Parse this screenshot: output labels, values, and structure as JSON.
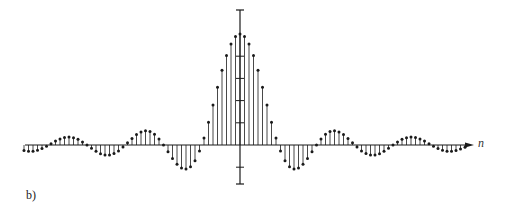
{
  "figure": {
    "panel_label": "b)",
    "axis_label_x": "n"
  },
  "colors": {
    "ink": "#1a1a1a",
    "background": "#ffffff"
  },
  "chart_data": {
    "type": "stem",
    "title": "",
    "xlabel": "n",
    "ylabel": "",
    "x_range": [
      -48,
      50
    ],
    "ylim": [
      -0.25,
      1.2
    ],
    "grid": false,
    "legend": null,
    "y_axis_ticks": [
      -0.2,
      0.2,
      0.4,
      0.6,
      0.8,
      1.2
    ],
    "n": [
      -48,
      -47,
      -46,
      -45,
      -44,
      -43,
      -42,
      -41,
      -40,
      -39,
      -38,
      -37,
      -36,
      -35,
      -34,
      -33,
      -32,
      -31,
      -30,
      -29,
      -28,
      -27,
      -26,
      -25,
      -24,
      -23,
      -22,
      -21,
      -20,
      -19,
      -18,
      -17,
      -16,
      -15,
      -14,
      -13,
      -12,
      -11,
      -10,
      -9,
      -8,
      -7,
      -6,
      -5,
      -4,
      -3,
      -2,
      -1,
      0,
      1,
      2,
      3,
      4,
      5,
      6,
      7,
      8,
      9,
      10,
      11,
      12,
      13,
      14,
      15,
      16,
      17,
      18,
      19,
      20,
      21,
      22,
      23,
      24,
      25,
      26,
      27,
      28,
      29,
      30,
      31,
      32,
      33,
      34,
      35,
      36,
      37,
      38,
      39,
      40,
      41,
      42,
      43,
      44,
      45,
      46,
      47,
      48,
      49,
      50
    ],
    "values": [
      -0.05,
      -0.057,
      -0.057,
      -0.048,
      -0.032,
      -0.012,
      0.012,
      0.035,
      0.054,
      0.067,
      0.071,
      0.065,
      0.051,
      0.028,
      0.0,
      -0.03,
      -0.057,
      -0.078,
      -0.09,
      -0.09,
      -0.077,
      -0.053,
      -0.019,
      0.02,
      0.059,
      0.094,
      0.118,
      0.128,
      0.121,
      0.096,
      0.054,
      0.0,
      -0.061,
      -0.122,
      -0.173,
      -0.207,
      -0.217,
      -0.196,
      -0.143,
      -0.055,
      0.062,
      0.204,
      0.36,
      0.52,
      0.673,
      0.807,
      0.911,
      0.977,
      1.0,
      0.977,
      0.911,
      0.807,
      0.673,
      0.52,
      0.36,
      0.204,
      0.062,
      -0.055,
      -0.143,
      -0.196,
      -0.217,
      -0.207,
      -0.173,
      -0.122,
      -0.061,
      0.0,
      0.054,
      0.096,
      0.121,
      0.128,
      0.118,
      0.094,
      0.059,
      0.02,
      -0.019,
      -0.053,
      -0.077,
      -0.09,
      -0.09,
      -0.078,
      -0.057,
      -0.03,
      0.0,
      0.028,
      0.051,
      0.065,
      0.071,
      0.067,
      0.054,
      0.035,
      0.012,
      -0.012,
      -0.032,
      -0.048,
      -0.057,
      -0.057,
      -0.05,
      -0.037,
      -0.02
    ]
  },
  "layout": {
    "origin_x": 240,
    "origin_y": 145,
    "px_per_sample": 4.5,
    "px_per_unit": 111,
    "axis_left": 25,
    "axis_right": 474,
    "yaxis_top": 10,
    "yaxis_bottom": 184
  }
}
